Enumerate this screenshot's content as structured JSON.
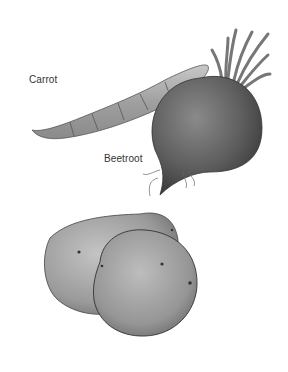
{
  "illustration": {
    "labels": {
      "carrot": "Carrot",
      "beetroot": "Beetroot"
    },
    "subjects": [
      "carrot",
      "beetroot",
      "potatoes"
    ],
    "colors": {
      "background": "#ffffff",
      "carrot": "#a8a8a8",
      "beetroot": "#5c5c5c",
      "potato": "#9a9a9a",
      "label_text": "#333333"
    }
  }
}
